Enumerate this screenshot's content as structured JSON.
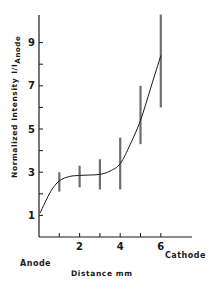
{
  "chart_data": {
    "type": "line",
    "title": "",
    "xlabel": "Distance mm",
    "ylabel": "Normalized Intensity I/I_Anode",
    "ylabel_main": "Normalized Intensity",
    "ylabel_ratio": "I/I",
    "ylabel_subscript": "Anode",
    "x_left_annotation": "Anode",
    "x_right_annotation": "Cathode",
    "xlim": [
      0,
      7.5
    ],
    "ylim": [
      0,
      10.3
    ],
    "x_ticks": [
      1,
      2,
      3,
      4,
      5,
      6
    ],
    "x_tick_labels": [
      "",
      "2",
      "",
      "4",
      "",
      "6"
    ],
    "y_ticks": [
      1,
      2,
      3,
      4,
      5,
      6,
      7,
      8,
      9
    ],
    "y_tick_labels": [
      "1",
      "",
      "3",
      "",
      "5",
      "",
      "7",
      "",
      "9"
    ],
    "grid": false,
    "legend": "none",
    "series": [
      {
        "name": "Normalized intensity (fitted curve)",
        "x": [
          0.05,
          0.3,
          0.6,
          1,
          1.5,
          2,
          2.5,
          3,
          3.5,
          4,
          4.5,
          5,
          5.5,
          6
        ],
        "values": [
          1.1,
          1.6,
          2.15,
          2.6,
          2.8,
          2.85,
          2.87,
          2.9,
          3.05,
          3.4,
          4.3,
          5.4,
          6.9,
          8.4
        ]
      }
    ],
    "error_bars": [
      {
        "x": 1,
        "y": 2.6,
        "low": 2.1,
        "high": 3.0
      },
      {
        "x": 2,
        "y": 2.85,
        "low": 2.3,
        "high": 3.3
      },
      {
        "x": 3,
        "y": 2.9,
        "low": 2.2,
        "high": 3.6
      },
      {
        "x": 4,
        "y": 3.4,
        "low": 2.2,
        "high": 4.6
      },
      {
        "x": 5,
        "y": 5.4,
        "low": 4.3,
        "high": 7.0
      },
      {
        "x": 6,
        "y": 8.4,
        "low": 6.0,
        "high": 10.3
      }
    ],
    "colors": {
      "ink": "#1a1a1a",
      "error_bar": "#6e6e6e",
      "background": "#ffffff"
    }
  }
}
